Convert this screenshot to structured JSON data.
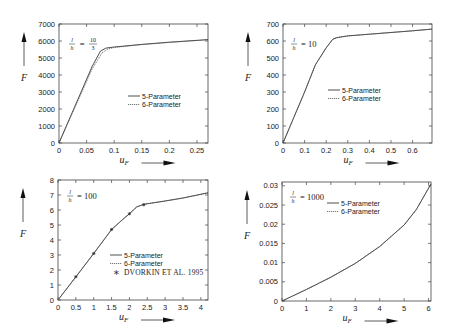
{
  "chart_data": [
    {
      "type": "line",
      "title": "l/h = 10/3",
      "annotation": "l/h = 10/3",
      "xlabel": "u_F",
      "ylabel": "F",
      "xlim": [
        0,
        0.27
      ],
      "ylim": [
        0,
        7000
      ],
      "xticks": [
        "0",
        "0.05",
        "0.1",
        "0.15",
        "0.2",
        "0.25"
      ],
      "yticks": [
        "0",
        "1000",
        "2000",
        "3000",
        "4000",
        "5000",
        "6000",
        "7000"
      ],
      "legend": [
        "5-Parameter",
        "6-Parameter"
      ],
      "legend_position": "center-right",
      "series": [
        {
          "name": "5-Parameter",
          "style": "solid",
          "x": [
            0,
            0.02,
            0.04,
            0.06,
            0.075,
            0.085,
            0.1,
            0.15,
            0.2,
            0.27
          ],
          "y": [
            0,
            1500,
            3000,
            4500,
            5400,
            5580,
            5650,
            5800,
            5930,
            6080
          ]
        },
        {
          "name": "6-Parameter",
          "style": "dotted",
          "x": [
            0,
            0.02,
            0.04,
            0.06,
            0.078,
            0.088,
            0.1,
            0.15,
            0.2,
            0.27
          ],
          "y": [
            0,
            1450,
            2900,
            4350,
            5300,
            5520,
            5620,
            5790,
            5920,
            6070
          ]
        }
      ]
    },
    {
      "type": "line",
      "title": "l/h = 10",
      "annotation": "l/h = 10",
      "xlabel": "u_F",
      "ylabel": "F",
      "xlim": [
        0,
        0.69
      ],
      "ylim": [
        0,
        700
      ],
      "xticks": [
        "0",
        "0.1",
        "0.2",
        "0.3",
        "0.4",
        "0.5",
        "0.6"
      ],
      "yticks": [
        "0",
        "100",
        "200",
        "300",
        "400",
        "500",
        "600",
        "700"
      ],
      "legend": [
        "5-Parameter",
        "6-Parameter"
      ],
      "legend_position": "center-right",
      "series": [
        {
          "name": "5-Parameter",
          "style": "solid",
          "x": [
            0,
            0.05,
            0.1,
            0.15,
            0.2,
            0.23,
            0.25,
            0.3,
            0.4,
            0.5,
            0.6,
            0.69
          ],
          "y": [
            0,
            150,
            300,
            460,
            560,
            610,
            620,
            630,
            640,
            650,
            660,
            670
          ]
        },
        {
          "name": "6-Parameter",
          "style": "dotted",
          "x": [
            0,
            0.05,
            0.1,
            0.15,
            0.2,
            0.23,
            0.25,
            0.3,
            0.4,
            0.5,
            0.6,
            0.69
          ],
          "y": [
            0,
            150,
            300,
            460,
            560,
            610,
            620,
            630,
            640,
            650,
            660,
            670
          ]
        }
      ]
    },
    {
      "type": "line",
      "title": "l/h = 100",
      "annotation": "l/h = 100",
      "xlabel": "u_F",
      "ylabel": "F",
      "xlim": [
        0,
        4.2
      ],
      "ylim": [
        0,
        8
      ],
      "xticks": [
        "0",
        "0.5",
        "1",
        "1.5",
        "2",
        "2.5",
        "3",
        "3.5",
        "4"
      ],
      "yticks": [
        "0",
        "1",
        "2",
        "3",
        "4",
        "5",
        "6",
        "7",
        "8"
      ],
      "legend": [
        "5-Parameter",
        "6-Parameter",
        "Dvorkin et al. 1995"
      ],
      "legend_position": "lower-right",
      "series": [
        {
          "name": "5-Parameter",
          "style": "solid",
          "x": [
            0,
            0.5,
            1,
            1.5,
            1.8,
            2,
            2.2,
            2.4,
            3,
            3.5,
            4.2
          ],
          "y": [
            0,
            1.55,
            3.1,
            4.7,
            5.35,
            5.75,
            6.2,
            6.38,
            6.6,
            6.8,
            7.15
          ]
        },
        {
          "name": "6-Parameter",
          "style": "dotted",
          "x": [
            0,
            0.5,
            1,
            1.5,
            1.8,
            2,
            2.2,
            2.4,
            3,
            3.5,
            4.2
          ],
          "y": [
            0,
            1.55,
            3.1,
            4.7,
            5.35,
            5.75,
            6.2,
            6.38,
            6.6,
            6.8,
            7.15
          ]
        },
        {
          "name": "Dvorkin et al. 1995",
          "style": "markers",
          "x": [
            0.5,
            1,
            1.5,
            2,
            2.4
          ],
          "y": [
            1.55,
            3.1,
            4.7,
            5.75,
            6.35
          ]
        }
      ]
    },
    {
      "type": "line",
      "title": "l/h = 1000",
      "annotation": "l/h = 1000",
      "xlabel": "u_F",
      "ylabel": "F",
      "xlim": [
        0,
        6.1
      ],
      "ylim": [
        0,
        0.031
      ],
      "xticks": [
        "0",
        "1",
        "2",
        "3",
        "4",
        "5",
        "6"
      ],
      "yticks": [
        "0",
        "0.005",
        "0.01",
        "0.015",
        "0.02",
        "0.025",
        "0.03"
      ],
      "legend": [
        "5-Parameter",
        "6-Parameter"
      ],
      "legend_position": "upper-center",
      "series": [
        {
          "name": "5-Parameter",
          "style": "solid",
          "x": [
            0,
            1,
            2,
            3,
            4,
            5,
            5.5,
            6.1
          ],
          "y": [
            0,
            0.003,
            0.0062,
            0.0098,
            0.0142,
            0.0198,
            0.0238,
            0.0305
          ]
        },
        {
          "name": "6-Parameter",
          "style": "dotted",
          "x": [
            0,
            1,
            2,
            3,
            4,
            5,
            5.5,
            6.1
          ],
          "y": [
            0,
            0.003,
            0.0062,
            0.0098,
            0.0142,
            0.0198,
            0.0238,
            0.0305
          ]
        }
      ]
    }
  ],
  "panels": [
    {
      "ratio_num": "10",
      "ratio_den": "3",
      "ratio_text": "= ",
      "legend": [
        "5-Parameter",
        "6-Parameter"
      ]
    },
    {
      "ratio_text": "= 10",
      "legend": [
        "5-Parameter",
        "6-Parameter"
      ]
    },
    {
      "ratio_text": "= 100",
      "legend": [
        "5-Parameter",
        "6-Parameter",
        "Dvorkin et al. 1995"
      ]
    },
    {
      "ratio_text": "= 1000",
      "legend": [
        "5-Parameter",
        "6-Parameter"
      ]
    }
  ],
  "axis_labels": {
    "y": "F",
    "x": "u",
    "x_sub": "F",
    "ratio_l": "l",
    "ratio_h": "h"
  }
}
